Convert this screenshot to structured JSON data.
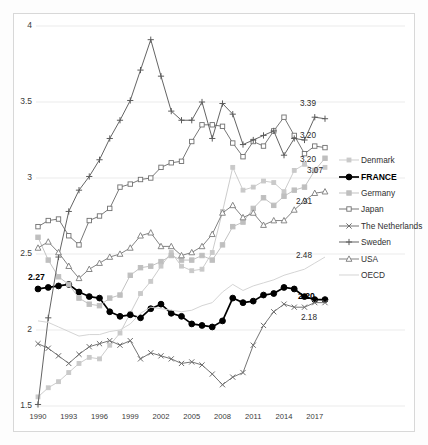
{
  "chart_data": {
    "type": "line",
    "title": "",
    "xlabel": "",
    "ylabel": "",
    "xlim": [
      1990,
      2018
    ],
    "ylim": [
      1.5,
      4
    ],
    "ytick_step": 0.5,
    "yticks": [
      "1.5",
      "2",
      "2.5",
      "3",
      "3.5",
      "4"
    ],
    "xticks": [
      "1990",
      "1993",
      "1996",
      "1999",
      "2002",
      "2005",
      "2008",
      "2011",
      "2014",
      "2017"
    ],
    "x": [
      1990,
      1991,
      1992,
      1993,
      1994,
      1995,
      1996,
      1997,
      1998,
      1999,
      2000,
      2001,
      2002,
      2003,
      2004,
      2005,
      2006,
      2007,
      2008,
      2009,
      2010,
      2011,
      2012,
      2013,
      2014,
      2015,
      2016,
      2017,
      2018
    ],
    "grid": "horizontal",
    "legend_position": "right",
    "series": [
      {
        "name": "Denmark",
        "marker": "small-square",
        "color": "#c9c9c9",
        "emphasis": false,
        "values": [
          1.56,
          1.62,
          1.66,
          1.72,
          1.78,
          1.82,
          1.81,
          1.9,
          1.98,
          2.11,
          2.24,
          2.32,
          2.42,
          2.51,
          2.42,
          2.39,
          2.4,
          2.51,
          2.78,
          3.07,
          2.92,
          2.94,
          2.98,
          2.97,
          2.91,
          3.05,
          3.09,
          3.05,
          3.07
        ]
      },
      {
        "name": "FRANCE",
        "marker": "filled-circle",
        "color": "#000000",
        "emphasis": true,
        "values": [
          2.27,
          2.28,
          2.29,
          2.3,
          2.25,
          2.22,
          2.21,
          2.12,
          2.09,
          2.1,
          2.08,
          2.14,
          2.17,
          2.11,
          2.09,
          2.04,
          2.03,
          2.02,
          2.06,
          2.21,
          2.18,
          2.19,
          2.23,
          2.24,
          2.28,
          2.27,
          2.22,
          2.2,
          2.2
        ]
      },
      {
        "name": "Germany",
        "marker": "filled-square",
        "color": "#bfbfbf",
        "emphasis": false,
        "values": [
          2.61,
          2.46,
          2.35,
          2.3,
          2.21,
          2.17,
          2.16,
          2.21,
          2.23,
          2.36,
          2.41,
          2.42,
          2.45,
          2.49,
          2.46,
          2.46,
          2.49,
          2.46,
          2.56,
          2.68,
          2.71,
          2.8,
          2.87,
          2.82,
          2.88,
          2.92,
          2.94,
          3.05,
          3.13
        ]
      },
      {
        "name": "Japan",
        "marker": "open-square",
        "color": "#707070",
        "emphasis": false,
        "values": [
          2.68,
          2.72,
          2.73,
          2.62,
          2.56,
          2.72,
          2.75,
          2.8,
          2.94,
          2.96,
          2.99,
          3.0,
          3.07,
          3.1,
          3.11,
          3.24,
          3.35,
          3.35,
          3.34,
          3.23,
          3.14,
          3.24,
          3.21,
          3.31,
          3.4,
          3.28,
          3.16,
          3.21,
          3.2
        ]
      },
      {
        "name": "The Netherlands",
        "marker": "cross-x",
        "color": "#6d6d6d",
        "emphasis": false,
        "values": [
          1.91,
          1.88,
          1.83,
          1.78,
          1.84,
          1.89,
          1.91,
          1.93,
          1.9,
          1.93,
          1.81,
          1.85,
          1.83,
          1.81,
          1.78,
          1.79,
          1.77,
          1.71,
          1.64,
          1.69,
          1.72,
          1.9,
          2.03,
          2.12,
          2.17,
          2.15,
          2.15,
          2.18,
          2.18
        ]
      },
      {
        "name": "Sweden",
        "marker": "plus",
        "color": "#5c5c5c",
        "emphasis": false,
        "values": [
          1.51,
          2.08,
          2.48,
          2.78,
          2.92,
          3.01,
          3.12,
          3.26,
          3.38,
          3.51,
          3.71,
          3.91,
          3.67,
          3.44,
          3.38,
          3.38,
          3.5,
          3.26,
          3.49,
          3.42,
          3.22,
          3.25,
          3.28,
          3.31,
          3.15,
          3.26,
          3.25,
          3.4,
          3.39
        ]
      },
      {
        "name": "USA",
        "marker": "open-triangle",
        "color": "#7c7c7c",
        "emphasis": false,
        "values": [
          2.54,
          2.58,
          2.51,
          2.42,
          2.34,
          2.4,
          2.44,
          2.48,
          2.5,
          2.54,
          2.62,
          2.64,
          2.55,
          2.55,
          2.49,
          2.51,
          2.55,
          2.63,
          2.77,
          2.82,
          2.74,
          2.77,
          2.69,
          2.72,
          2.72,
          2.79,
          2.85,
          2.9,
          2.91
        ]
      },
      {
        "name": "OECD",
        "marker": "none",
        "color": "#d2d2d2",
        "emphasis": false,
        "values": [
          2.06,
          2.05,
          2.02,
          1.99,
          1.96,
          1.97,
          1.97,
          1.99,
          2.0,
          2.04,
          2.11,
          2.15,
          2.14,
          2.13,
          2.12,
          2.13,
          2.16,
          2.18,
          2.25,
          2.3,
          2.26,
          2.29,
          2.31,
          2.33,
          2.36,
          2.38,
          2.4,
          2.44,
          2.48
        ]
      }
    ],
    "end_labels": [
      {
        "text": "3.39",
        "series": "Sweden",
        "bold": false,
        "x": 300,
        "y": 99
      },
      {
        "text": "3.20",
        "series": "Japan",
        "bold": false,
        "x": 300,
        "y": 131
      },
      {
        "text": "3.20",
        "series": "Germany",
        "bold": false,
        "x": 300,
        "y": 155
      },
      {
        "text": "3.07",
        "series": "Denmark",
        "bold": false,
        "x": 307,
        "y": 166
      },
      {
        "text": "2.91",
        "series": "USA",
        "bold": false,
        "x": 296,
        "y": 197
      },
      {
        "text": "2.48",
        "series": "OECD",
        "bold": false,
        "x": 296,
        "y": 251
      },
      {
        "text": "2.20",
        "series": "FRANCE",
        "bold": true,
        "x": 298,
        "y": 291
      },
      {
        "text": "2.18",
        "series": "The Netherlands",
        "bold": false,
        "x": 301,
        "y": 313
      },
      {
        "text": "2.27",
        "series": "FRANCE",
        "bold": true,
        "x": 28,
        "y": 272
      }
    ]
  },
  "legend": {
    "items": [
      {
        "label": "Denmark",
        "marker": "small-square",
        "color": "#c9c9c9",
        "bold": false
      },
      {
        "label": "FRANCE",
        "marker": "filled-circle",
        "color": "#000000",
        "bold": true
      },
      {
        "label": "Germany",
        "marker": "filled-square",
        "color": "#bfbfbf",
        "bold": false
      },
      {
        "label": "Japan",
        "marker": "open-square",
        "color": "#707070",
        "bold": false
      },
      {
        "label": "The Netherlands",
        "marker": "cross-x",
        "color": "#6d6d6d",
        "bold": false
      },
      {
        "label": "Sweden",
        "marker": "plus",
        "color": "#5c5c5c",
        "bold": false
      },
      {
        "label": "USA",
        "marker": "open-triangle",
        "color": "#7c7c7c",
        "bold": false
      },
      {
        "label": "OECD",
        "marker": "none",
        "color": "#d2d2d2",
        "bold": false
      }
    ]
  }
}
